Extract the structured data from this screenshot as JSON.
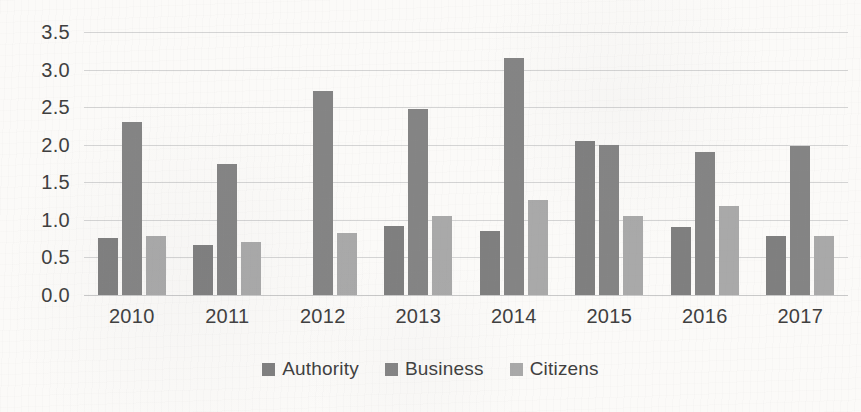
{
  "chart_data": {
    "type": "bar",
    "title": "",
    "subtitle": "",
    "xlabel": "",
    "ylabel": "",
    "categories": [
      "2010",
      "2011",
      "2012",
      "2013",
      "2014",
      "2015",
      "2016",
      "2017"
    ],
    "series": [
      {
        "name": "Authority",
        "color": "#7f7f7f",
        "values": [
          0.76,
          0.67,
          0.0,
          0.92,
          0.85,
          2.05,
          0.9,
          0.78
        ]
      },
      {
        "name": "Business",
        "color": "#848484",
        "values": [
          2.3,
          1.74,
          2.72,
          2.47,
          3.15,
          2.0,
          1.9,
          1.98
        ]
      },
      {
        "name": "Citizens",
        "color": "#a9a9a9",
        "values": [
          0.79,
          0.7,
          0.82,
          1.05,
          1.26,
          1.05,
          1.18,
          0.78
        ]
      }
    ],
    "ylim": [
      0.0,
      3.5
    ],
    "ytick_labels": [
      "3.5",
      "3.0",
      "2.5",
      "2.0",
      "1.5",
      "1.0",
      "0.5",
      "0.0"
    ],
    "ytick_values": [
      3.5,
      3.0,
      2.5,
      2.0,
      1.5,
      1.0,
      0.5,
      0.0
    ],
    "grid": true,
    "legend_position": "bottom",
    "background_color": "#fbfaf8",
    "gridline_color": "#d4d4d4",
    "text_color": "#3f3f3f"
  }
}
